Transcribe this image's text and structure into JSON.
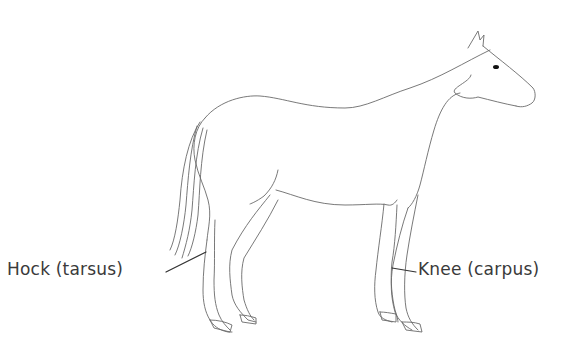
{
  "figure": {
    "labels": [
      {
        "id": "hock",
        "text": "Hock (tarsus)",
        "points_to": "hind leg"
      },
      {
        "id": "knee",
        "text": "Knee (carpus)",
        "points_to": "foreleg"
      }
    ]
  },
  "colors": {
    "background": "#ffffff",
    "outline": "#6a6a6a",
    "label_text": "#3a3a3a",
    "leader_line": "#333333"
  }
}
